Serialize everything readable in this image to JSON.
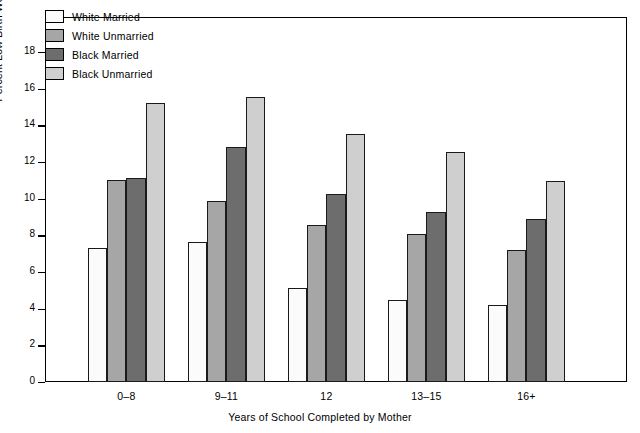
{
  "chart_data": {
    "type": "bar",
    "title": "",
    "xlabel": "Years of School Completed by Mother",
    "ylabel": "Percent Low Birth Weight",
    "categories": [
      "0–8",
      "9–11",
      "12",
      "13–15",
      "16+"
    ],
    "ylim": [
      0,
      19
    ],
    "yticks": [
      0,
      2,
      4,
      6,
      8,
      10,
      12,
      14,
      16,
      18
    ],
    "grid": false,
    "legend_position": "top-left",
    "series": [
      {
        "name": "White Married",
        "color": "#fbfbfb",
        "values": [
          7.3,
          7.65,
          5.15,
          4.5,
          4.2
        ]
      },
      {
        "name": "White Unmarried",
        "color": "#a6a6a6",
        "values": [
          11.0,
          9.85,
          8.55,
          8.05,
          7.2
        ]
      },
      {
        "name": "Black Married",
        "color": "#6d6d6d",
        "values": [
          11.15,
          12.8,
          10.25,
          9.3,
          8.9
        ]
      },
      {
        "name": "Black Unmarried",
        "color": "#cfcfcf",
        "values": [
          15.2,
          15.55,
          13.55,
          12.55,
          10.95
        ]
      }
    ]
  }
}
